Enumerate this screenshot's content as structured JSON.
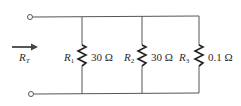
{
  "diagram": {
    "type": "parallel resistor circuit",
    "colors": {
      "wire": "#555555",
      "text": "#2a2a2a",
      "background": "#ffffff"
    },
    "input": {
      "label_main": "R",
      "label_sub": "T",
      "arrow_direction": "right"
    },
    "terminals": [
      {
        "name": "top-terminal",
        "x": 30,
        "y": 17
      },
      {
        "name": "bottom-terminal",
        "x": 31,
        "y": 94
      }
    ],
    "resistors": [
      {
        "id": "R1",
        "label_main": "R",
        "label_sub": "1",
        "value": "30 Ω",
        "x": 82
      },
      {
        "id": "R2",
        "label_main": "R",
        "label_sub": "2",
        "value": "30 Ω",
        "x": 142
      },
      {
        "id": "R3",
        "label_main": "R",
        "label_sub": "3",
        "value": "0.1 Ω",
        "x": 199
      }
    ]
  }
}
